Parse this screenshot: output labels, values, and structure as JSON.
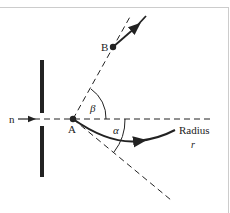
{
  "diagram": {
    "labels": {
      "incoming": "n",
      "point_a": "A",
      "point_b": "B",
      "angle_beta": "β",
      "angle_alpha": "α",
      "radius": "Radius",
      "radius_symbol": "r"
    },
    "colors": {
      "line": "#222222",
      "frame": "#cccccc",
      "background": "#ffffff"
    }
  }
}
